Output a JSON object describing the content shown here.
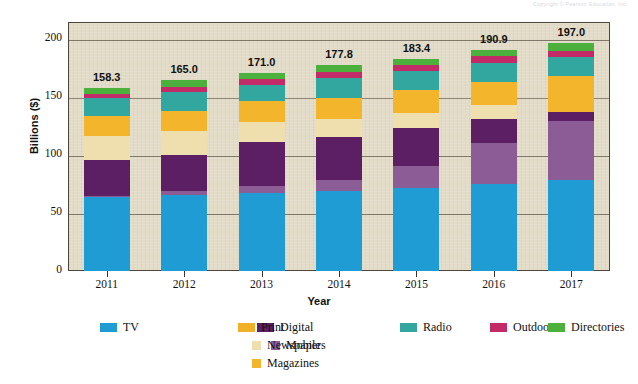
{
  "copyright_note": "Copyright © Pearson Education, Inc.",
  "chart_data": {
    "type": "bar",
    "stacked": true,
    "title": "",
    "xlabel": "Year",
    "ylabel": "Billions ($)",
    "categories": [
      "2011",
      "2012",
      "2013",
      "2014",
      "2015",
      "2016",
      "2017"
    ],
    "ylim": [
      0,
      215
    ],
    "yticks": [
      0,
      50,
      100,
      150,
      200
    ],
    "ytick_labels": [
      "0",
      "50",
      "100",
      "150",
      "200"
    ],
    "grid": true,
    "legend_position": "bottom",
    "bar_totals": [
      "158.3",
      "165.0",
      "171.0",
      "177.8",
      "183.4",
      "190.9",
      "197.0"
    ],
    "totals": [
      158.3,
      165.0,
      171.0,
      177.8,
      183.4,
      190.9,
      197.0
    ],
    "series": [
      {
        "name": "TV",
        "color": "#1f9cd4",
        "values": [
          63.5,
          65.5,
          67.5,
          69.5,
          71.5,
          75.0,
          78.5
        ]
      },
      {
        "name": "Mobile",
        "color": "#8c5c96",
        "values": [
          1.5,
          3.5,
          5.5,
          9.0,
          19.5,
          35.5,
          51.0
        ]
      },
      {
        "name": "Digital",
        "color": "#5d1f63",
        "values": [
          31.0,
          31.5,
          38.0,
          37.0,
          32.5,
          21.0,
          7.5
        ]
      },
      {
        "name": "Newspapers",
        "color": "#efdfae",
        "values": [
          20.5,
          20.0,
          17.5,
          15.5,
          13.0,
          11.5,
          0.0
        ]
      },
      {
        "name": "Magazines",
        "color": "#f2b52c",
        "values": [
          17.5,
          18.0,
          18.0,
          18.5,
          19.5,
          20.5,
          31.0
        ]
      },
      {
        "name": "Radio",
        "color": "#31a7a0",
        "values": [
          15.0,
          16.0,
          14.5,
          17.0,
          17.0,
          16.5,
          16.5
        ]
      },
      {
        "name": "Outdoor",
        "color": "#c22a68",
        "values": [
          3.8,
          4.0,
          4.5,
          5.0,
          5.2,
          5.4,
          5.5
        ]
      },
      {
        "name": "Directories",
        "color": "#4cb13c",
        "values": [
          5.5,
          6.5,
          5.5,
          6.3,
          5.2,
          5.5,
          7.0
        ]
      }
    ]
  },
  "legend": {
    "columns": [
      {
        "items": [
          {
            "label": "TV",
            "color": "#1f9cd4",
            "sub": false
          }
        ]
      },
      {
        "items": [
          {
            "label": "Digital",
            "color": "#5d1f63",
            "sub": false
          },
          {
            "label": "Mobile",
            "color": "#8c5c96",
            "sub": true
          }
        ]
      },
      {
        "items": [
          {
            "label": "Print",
            "color": "#f0b128",
            "sub": false
          },
          {
            "label": "Newspapers",
            "color": "#efdfae",
            "sub": true
          },
          {
            "label": "Magazines",
            "color": "#f2b52c",
            "sub": true
          }
        ]
      },
      {
        "items": [
          {
            "label": "Radio",
            "color": "#31a7a0",
            "sub": false
          }
        ]
      },
      {
        "items": [
          {
            "label": "Outdoor",
            "color": "#c22a68",
            "sub": false
          }
        ]
      },
      {
        "items": [
          {
            "label": "Directories",
            "color": "#4cb13c",
            "sub": false
          }
        ]
      }
    ],
    "column_left": [
      100,
      258,
      455,
      790,
      975,
      1215
    ]
  },
  "colors": {
    "plot_background": "#e2dbc7",
    "plot_border": "#4c463c",
    "gridline": "#6d6557",
    "page_background": "#ffffff",
    "text": "#111111"
  }
}
